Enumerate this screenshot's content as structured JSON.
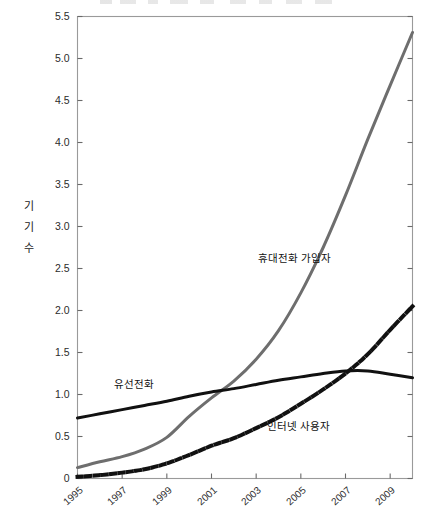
{
  "chart_data": {
    "type": "line",
    "title": "",
    "xlabel": "",
    "ylabel": "기기수",
    "ylabel_chars": [
      "기",
      "기",
      "수"
    ],
    "xlim": [
      1995,
      2010
    ],
    "ylim": [
      0,
      5.5
    ],
    "grid": false,
    "legend_position": "inline-annotations",
    "x": [
      1995,
      1996,
      1997,
      1998,
      1999,
      2000,
      2001,
      2002,
      2003,
      2004,
      2005,
      2006,
      2007,
      2008,
      2009,
      2010
    ],
    "y_ticks": [
      "0",
      "0.5",
      "1.0",
      "1.5",
      "2.0",
      "2.5",
      "3.0",
      "3.5",
      "4.0",
      "4.5",
      "5.0",
      "5.5"
    ],
    "y_tick_values": [
      0,
      0.5,
      1.0,
      1.5,
      2.0,
      2.5,
      3.0,
      3.5,
      4.0,
      4.5,
      5.0,
      5.5
    ],
    "x_ticks": [
      "1995",
      "1997",
      "1999",
      "2001",
      "2003",
      "2005",
      "2007",
      "2009"
    ],
    "x_tick_values": [
      1995,
      1997,
      1999,
      2001,
      2003,
      2005,
      2007,
      2009
    ],
    "series": [
      {
        "name": "휴대전화 가입자",
        "style": "solid",
        "color": "#6e6e6e",
        "width": 3.0,
        "label_x": 2003.1,
        "label_y": 2.62,
        "values": [
          0.13,
          0.2,
          0.26,
          0.35,
          0.49,
          0.74,
          0.96,
          1.16,
          1.42,
          1.76,
          2.21,
          2.75,
          3.37,
          4.04,
          4.68,
          5.31
        ]
      },
      {
        "name": "유선전화",
        "style": "solid",
        "color": "#111111",
        "width": 3.0,
        "label_x": 1996.8,
        "label_y": 1.12,
        "values": [
          0.72,
          0.77,
          0.82,
          0.87,
          0.92,
          0.98,
          1.03,
          1.07,
          1.12,
          1.17,
          1.21,
          1.25,
          1.28,
          1.28,
          1.24,
          1.2
        ]
      },
      {
        "name": "인터넷 사용자",
        "style": "dotted",
        "color": "#111111",
        "width": 4.0,
        "label_x": 2003.5,
        "label_y": 0.62,
        "values": [
          0.02,
          0.04,
          0.07,
          0.11,
          0.18,
          0.28,
          0.39,
          0.48,
          0.6,
          0.73,
          0.89,
          1.06,
          1.25,
          1.48,
          1.77,
          2.05
        ]
      }
    ]
  },
  "axis": {
    "frame_color": "#9a9a9a",
    "tick_color": "#6a6a6a"
  }
}
